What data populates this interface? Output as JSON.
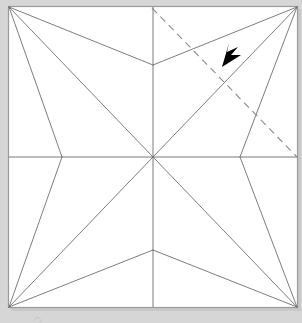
{
  "diagram": {
    "type": "origami-crease-pattern",
    "paper": {
      "shape": "square",
      "x": 8,
      "y": 6,
      "width": 290,
      "height": 302,
      "fill": "#ffffff",
      "stroke": "#9a9a9a",
      "stroke_width": 1.2
    },
    "background_color": "#d6d6d6",
    "shadow_color": "#bdbdbd",
    "crease_color": "#6e6e6e",
    "crease_width": 0.9,
    "fold_line_color": "#8c8c8c",
    "fold_line_width": 1.1,
    "fold_line_dash": "7 5",
    "arrow_color": "#000000",
    "vertices": [
      {
        "name": "corner-top-left",
        "x": 9,
        "y": 7
      },
      {
        "name": "corner-top-right",
        "x": 297,
        "y": 7
      },
      {
        "name": "corner-bottom-left",
        "x": 9,
        "y": 307
      },
      {
        "name": "corner-bottom-right",
        "x": 297,
        "y": 307
      },
      {
        "name": "center",
        "x": 153,
        "y": 157
      },
      {
        "name": "top-center-vertex",
        "x": 153,
        "y": 65
      },
      {
        "name": "bottom-center-vertex",
        "x": 153,
        "y": 250
      },
      {
        "name": "left-mid-vertex",
        "x": 62,
        "y": 157
      },
      {
        "name": "right-mid-vertex",
        "x": 240,
        "y": 157
      },
      {
        "name": "top-edge-midpoint",
        "x": 153,
        "y": 7
      },
      {
        "name": "bottom-edge-midpoint",
        "x": 153,
        "y": 307
      },
      {
        "name": "left-edge-midpoint",
        "x": 9,
        "y": 157
      },
      {
        "name": "right-edge-midpoint",
        "x": 297,
        "y": 157
      }
    ],
    "axis_creases": [
      {
        "name": "vertical-center-crease",
        "x1": 153,
        "y1": 7,
        "x2": 153,
        "y2": 307
      },
      {
        "name": "horizontal-center-crease",
        "x1": 9,
        "y1": 157,
        "x2": 297,
        "y2": 157
      }
    ],
    "creases": [
      {
        "name": "crease-tl-to-top-center",
        "x1": 9,
        "y1": 7,
        "x2": 153,
        "y2": 65
      },
      {
        "name": "crease-tl-to-center",
        "x1": 9,
        "y1": 7,
        "x2": 153,
        "y2": 157
      },
      {
        "name": "crease-tl-to-left-mid",
        "x1": 9,
        "y1": 7,
        "x2": 62,
        "y2": 157
      },
      {
        "name": "crease-tr-to-top-center",
        "x1": 297,
        "y1": 7,
        "x2": 153,
        "y2": 65
      },
      {
        "name": "crease-tr-to-center",
        "x1": 297,
        "y1": 7,
        "x2": 153,
        "y2": 157
      },
      {
        "name": "crease-tr-to-right-mid",
        "x1": 297,
        "y1": 7,
        "x2": 240,
        "y2": 157
      },
      {
        "name": "crease-bl-to-left-mid",
        "x1": 9,
        "y1": 307,
        "x2": 62,
        "y2": 157
      },
      {
        "name": "crease-bl-to-center",
        "x1": 9,
        "y1": 307,
        "x2": 153,
        "y2": 157
      },
      {
        "name": "crease-bl-to-bottom-center",
        "x1": 9,
        "y1": 307,
        "x2": 153,
        "y2": 250
      },
      {
        "name": "crease-br-to-right-mid",
        "x1": 297,
        "y1": 307,
        "x2": 240,
        "y2": 157
      },
      {
        "name": "crease-br-to-center",
        "x1": 297,
        "y1": 307,
        "x2": 153,
        "y2": 157
      },
      {
        "name": "crease-br-to-bottom-center",
        "x1": 297,
        "y1": 307,
        "x2": 153,
        "y2": 250
      }
    ],
    "fold_line": {
      "name": "dashed-fold-line",
      "x1": 152,
      "y1": 8,
      "x2": 297,
      "y2": 157
    },
    "arrow": {
      "name": "fold-direction-arrow",
      "tip_x": 222,
      "tip_y": 67,
      "direction": "down-left",
      "shaft_x1": 243,
      "shaft_y1": 48,
      "shaft_x2": 226,
      "shaft_y2": 63
    },
    "stray_mark": {
      "name": "page-artifact-mark",
      "x": 37,
      "y": 317
    }
  }
}
